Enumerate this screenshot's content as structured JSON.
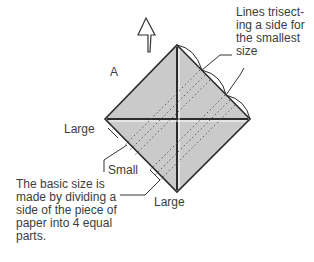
{
  "diagram": {
    "label_a": "A",
    "labels": {
      "trisect_note": "Lines trisect-\ning a side for\nthe smallest\nsize",
      "large_left": "Large",
      "small": "Small",
      "large_bottom": "Large",
      "basic_size_note": "The basic size is\nmade by dividing a\nside of the piece of\npaper into 4 equal\nparts."
    },
    "icons": {
      "direction_arrow": "up-arrow-icon"
    },
    "colors": {
      "paper_fill": "#c8c8c8",
      "line": "#2b2b2b",
      "text": "#3c3c3c"
    }
  }
}
